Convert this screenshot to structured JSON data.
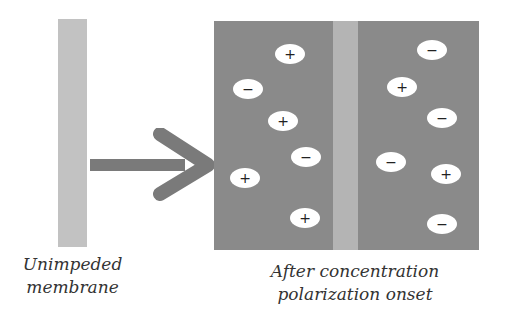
{
  "labels": {
    "left_line1": "Unimpeded",
    "left_line2": "membrane",
    "right_line1": "After concentration",
    "right_line2": "polarization onset"
  },
  "colors": {
    "membrane_light": "#c2c2c2",
    "solution_dark": "#8a8a8a",
    "arrow": "#7a7a7a",
    "ion_fill": "#ffffff"
  },
  "ions": {
    "left_side": [
      {
        "charge": "+",
        "x": 290,
        "y": 54
      },
      {
        "charge": "−",
        "x": 248,
        "y": 89
      },
      {
        "charge": "+",
        "x": 283,
        "y": 121
      },
      {
        "charge": "−",
        "x": 306,
        "y": 157
      },
      {
        "charge": "+",
        "x": 245,
        "y": 178
      },
      {
        "charge": "+",
        "x": 305,
        "y": 218
      }
    ],
    "right_side": [
      {
        "charge": "−",
        "x": 432,
        "y": 50
      },
      {
        "charge": "+",
        "x": 402,
        "y": 87
      },
      {
        "charge": "−",
        "x": 442,
        "y": 118
      },
      {
        "charge": "−",
        "x": 391,
        "y": 162
      },
      {
        "charge": "+",
        "x": 446,
        "y": 174
      },
      {
        "charge": "−",
        "x": 442,
        "y": 224
      }
    ]
  }
}
